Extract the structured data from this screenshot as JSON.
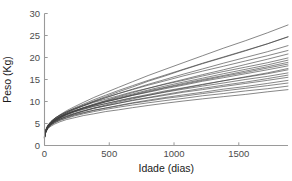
{
  "chart_data": {
    "type": "line",
    "title": "",
    "xlabel": "Idade (dias)",
    "ylabel": "Peso (Kg)",
    "xlim": [
      0,
      1880
    ],
    "ylim": [
      0,
      30
    ],
    "xticks": [
      0,
      500,
      1000,
      1500
    ],
    "xtick_labels": [
      "0",
      "500",
      "1000",
      "1500"
    ],
    "yticks": [
      0,
      5,
      10,
      15,
      20,
      25,
      30
    ],
    "ytick_labels": [
      "0",
      "5",
      "10",
      "15",
      "20",
      "25",
      "30"
    ],
    "grid": false,
    "legend": "none",
    "line_color": "#3c3c3c",
    "axis_color": "#9a9a9a",
    "background": "#ffffff",
    "x_sample_points": [
      0,
      10,
      25,
      50,
      80,
      120,
      170,
      230,
      300,
      380,
      470,
      570,
      680,
      800,
      930,
      1070,
      1220,
      1380,
      1550,
      1720,
      1880
    ],
    "series": [
      {
        "name": "curva-01",
        "values": [
          1.9,
          3.4,
          4.4,
          5.4,
          6.2,
          7.0,
          7.9,
          8.8,
          9.8,
          10.9,
          12.0,
          13.2,
          14.5,
          15.9,
          17.3,
          18.8,
          20.4,
          22.1,
          23.8,
          25.6,
          27.4
        ]
      },
      {
        "name": "curva-02",
        "values": [
          1.8,
          3.2,
          4.1,
          5.0,
          5.8,
          6.6,
          7.4,
          8.2,
          9.1,
          10.1,
          11.1,
          12.2,
          13.3,
          14.6,
          15.8,
          17.2,
          18.6,
          20.0,
          21.5,
          23.1,
          24.7
        ]
      },
      {
        "name": "curva-03",
        "values": [
          1.9,
          3.3,
          4.2,
          5.1,
          5.9,
          6.6,
          7.4,
          8.2,
          9.0,
          9.9,
          10.8,
          11.8,
          12.8,
          13.9,
          15.0,
          16.2,
          17.4,
          18.7,
          20.0,
          21.3,
          22.7
        ]
      },
      {
        "name": "curva-04",
        "values": [
          2.0,
          3.5,
          4.5,
          5.4,
          6.2,
          6.9,
          7.7,
          8.4,
          9.2,
          10.0,
          10.9,
          11.8,
          12.7,
          13.7,
          14.7,
          15.8,
          16.9,
          18.0,
          19.2,
          20.4,
          21.6
        ]
      },
      {
        "name": "curva-05",
        "values": [
          1.7,
          3.1,
          4.0,
          4.9,
          5.6,
          6.3,
          7.1,
          7.8,
          8.6,
          9.4,
          10.2,
          11.1,
          12.0,
          13.0,
          14.0,
          15.0,
          16.1,
          17.2,
          18.4,
          19.6,
          20.8
        ]
      },
      {
        "name": "curva-06",
        "values": [
          2.1,
          3.6,
          4.6,
          5.5,
          6.2,
          6.9,
          7.6,
          8.3,
          9.0,
          9.8,
          10.5,
          11.3,
          12.2,
          13.0,
          13.9,
          14.8,
          15.8,
          16.8,
          17.8,
          18.8,
          19.9
        ]
      },
      {
        "name": "curva-07",
        "values": [
          1.8,
          3.2,
          4.1,
          5.0,
          5.7,
          6.4,
          7.1,
          7.8,
          8.5,
          9.2,
          10.0,
          10.7,
          11.5,
          12.4,
          13.2,
          14.1,
          15.0,
          15.9,
          16.9,
          17.9,
          18.9
        ]
      },
      {
        "name": "curva-08",
        "values": [
          2.0,
          3.4,
          4.4,
          5.2,
          5.9,
          6.6,
          7.2,
          7.9,
          8.5,
          9.2,
          9.9,
          10.6,
          11.4,
          12.1,
          12.9,
          13.7,
          14.6,
          15.4,
          16.3,
          17.2,
          18.1
        ]
      },
      {
        "name": "curva-09",
        "values": [
          1.9,
          3.3,
          4.2,
          5.0,
          5.7,
          6.3,
          7.0,
          7.6,
          8.2,
          8.9,
          9.5,
          10.2,
          10.9,
          11.6,
          12.4,
          13.1,
          13.9,
          14.7,
          15.5,
          16.3,
          17.2
        ]
      },
      {
        "name": "curva-10",
        "values": [
          2.2,
          3.6,
          4.5,
          5.3,
          5.9,
          6.5,
          7.1,
          7.7,
          8.3,
          8.9,
          9.5,
          10.1,
          10.8,
          11.4,
          12.1,
          12.8,
          13.5,
          14.2,
          15.0,
          15.7,
          16.5
        ]
      },
      {
        "name": "curva-11",
        "values": [
          1.8,
          3.1,
          4.0,
          4.8,
          5.4,
          6.0,
          6.6,
          7.2,
          7.8,
          8.4,
          9.0,
          9.6,
          10.3,
          10.9,
          11.6,
          12.3,
          13.0,
          13.7,
          14.4,
          15.2,
          16.0
        ]
      },
      {
        "name": "curva-12",
        "values": [
          2.0,
          3.4,
          4.3,
          5.0,
          5.6,
          6.2,
          6.8,
          7.3,
          7.9,
          8.5,
          9.0,
          9.6,
          10.2,
          10.8,
          11.4,
          12.1,
          12.7,
          13.4,
          14.1,
          14.8,
          15.5
        ]
      },
      {
        "name": "curva-13",
        "values": [
          1.7,
          3.0,
          3.9,
          4.6,
          5.2,
          5.8,
          6.3,
          6.9,
          7.4,
          8.0,
          8.5,
          9.1,
          9.7,
          10.3,
          10.9,
          11.5,
          12.1,
          12.8,
          13.4,
          14.1,
          14.8
        ]
      },
      {
        "name": "curva-14",
        "values": [
          2.1,
          3.4,
          4.2,
          4.9,
          5.5,
          6.0,
          6.5,
          7.0,
          7.5,
          8.0,
          8.5,
          9.0,
          9.6,
          10.1,
          10.7,
          11.2,
          11.8,
          12.4,
          13.0,
          13.6,
          14.2
        ]
      },
      {
        "name": "curva-15",
        "values": [
          1.9,
          3.2,
          4.0,
          4.7,
          5.2,
          5.7,
          6.2,
          6.7,
          7.2,
          7.7,
          8.2,
          8.7,
          9.2,
          9.7,
          10.2,
          10.7,
          11.3,
          11.8,
          12.4,
          12.9,
          13.5
        ]
      },
      {
        "name": "curva-16",
        "values": [
          1.8,
          3.0,
          3.8,
          4.4,
          4.9,
          5.4,
          5.9,
          6.3,
          6.8,
          7.2,
          7.7,
          8.1,
          8.6,
          9.1,
          9.6,
          10.1,
          10.6,
          11.1,
          11.6,
          12.2,
          12.7
        ]
      },
      {
        "name": "curva-17",
        "values": [
          2.0,
          3.3,
          4.1,
          4.8,
          5.4,
          6.0,
          6.6,
          7.2,
          7.8,
          8.5,
          9.2,
          9.9,
          10.6,
          11.4,
          12.2,
          13.0,
          13.8,
          14.7,
          15.6,
          16.5,
          17.5
        ]
      },
      {
        "name": "curva-18",
        "values": [
          1.9,
          3.3,
          4.3,
          5.2,
          6.0,
          6.8,
          7.6,
          8.5,
          9.4,
          10.4,
          11.4,
          12.5,
          13.6,
          14.8,
          16.0,
          17.3,
          18.7,
          20.1,
          21.6,
          23.1,
          24.7
        ]
      },
      {
        "name": "curva-19",
        "values": [
          2.1,
          3.5,
          4.4,
          5.2,
          5.9,
          6.5,
          7.2,
          7.9,
          8.6,
          9.3,
          10.1,
          10.9,
          11.7,
          12.6,
          13.5,
          14.4,
          15.3,
          16.3,
          17.3,
          18.3,
          19.4
        ]
      },
      {
        "name": "curva-20",
        "values": [
          1.8,
          3.1,
          4.0,
          4.9,
          5.6,
          6.3,
          7.0,
          7.7,
          8.4,
          9.1,
          9.9,
          10.6,
          11.4,
          12.2,
          13.1,
          13.9,
          14.8,
          15.7,
          16.6,
          17.6,
          18.5
        ]
      }
    ]
  }
}
